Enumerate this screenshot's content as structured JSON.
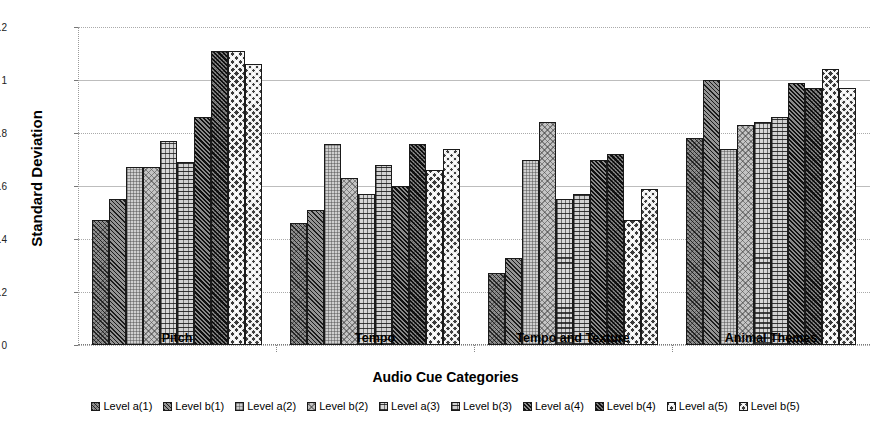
{
  "chart_data": {
    "type": "bar",
    "title": "",
    "xlabel": "Audio Cue Categories",
    "ylabel": "Standard Deviation",
    "categories": [
      "Pitch",
      "Tempo",
      "Tempo and Texture",
      "Animal Themes"
    ],
    "ylim": [
      0,
      1.2
    ],
    "yticks": [
      0,
      0.2,
      0.4,
      0.6,
      0.8,
      1,
      1.2
    ],
    "ytick_labels": [
      "0",
      "0.2",
      "0.4",
      "0.6",
      "0.8",
      "1",
      "1.2"
    ],
    "grid": true,
    "legend_position": "bottom",
    "series": [
      {
        "name": "Level a(1)",
        "pattern": "diagonal-crosshatch-dark",
        "values": [
          0.47,
          0.46,
          0.27,
          0.78
        ]
      },
      {
        "name": "Level b(1)",
        "pattern": "diagonal-dark",
        "values": [
          0.55,
          0.51,
          0.33,
          1.0
        ]
      },
      {
        "name": "Level a(2)",
        "pattern": "fine-grid-light",
        "values": [
          0.67,
          0.76,
          0.7,
          0.74
        ]
      },
      {
        "name": "Level b(2)",
        "pattern": "diagonal-crosshatch-light",
        "values": [
          0.67,
          0.63,
          0.84,
          0.83
        ]
      },
      {
        "name": "Level a(3)",
        "pattern": "horizontal-grid",
        "values": [
          0.77,
          0.57,
          0.55,
          0.84
        ]
      },
      {
        "name": "Level b(3)",
        "pattern": "horizontal-grid-dense",
        "values": [
          0.69,
          0.68,
          0.57,
          0.86
        ]
      },
      {
        "name": "Level a(4)",
        "pattern": "diagonal-dense",
        "values": [
          0.86,
          0.6,
          0.7,
          0.99
        ]
      },
      {
        "name": "Level b(4)",
        "pattern": "diagonal-dense-crosshatch",
        "values": [
          1.11,
          0.76,
          0.72,
          0.97
        ]
      },
      {
        "name": "Level a(5)",
        "pattern": "checkerboard",
        "values": [
          1.11,
          0.66,
          0.47,
          1.04
        ]
      },
      {
        "name": "Level b(5)",
        "pattern": "checkerboard-alt",
        "values": [
          1.06,
          0.74,
          0.59,
          0.97
        ]
      }
    ]
  }
}
